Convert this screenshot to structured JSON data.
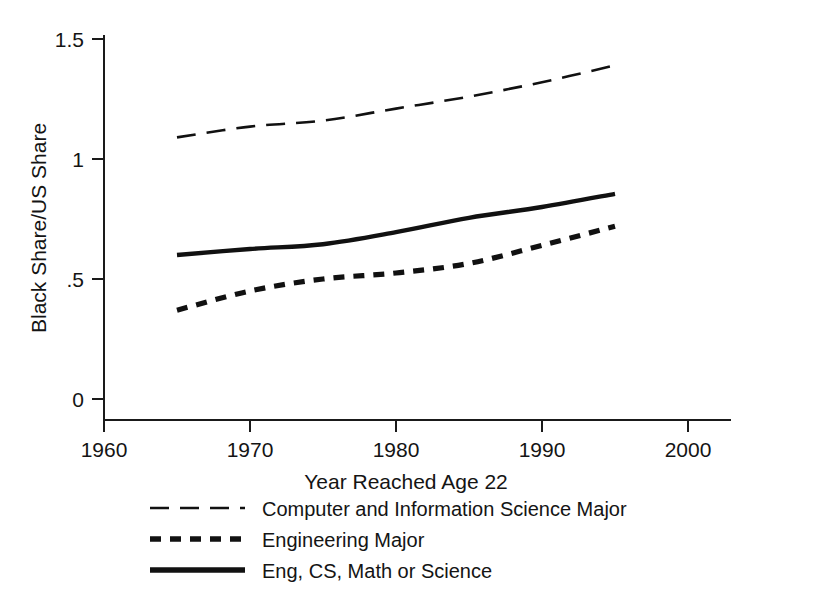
{
  "chart_data": {
    "type": "line",
    "title": "",
    "xlabel": "Year Reached Age 22",
    "ylabel": "Black Share/US Share",
    "xlim": [
      1960,
      2000
    ],
    "ylim": [
      0,
      1.5
    ],
    "grid": false,
    "legend_position": "below-plot",
    "x_ticks": [
      "1960",
      "1970",
      "1980",
      "1990",
      "2000"
    ],
    "x_tick_values": [
      1960,
      1970,
      1980,
      1990,
      2000
    ],
    "y_ticks": [
      "0",
      ".5",
      "1",
      "1.5"
    ],
    "y_tick_values": [
      0,
      0.5,
      1,
      1.5
    ],
    "x": [
      1965,
      1970,
      1975,
      1980,
      1985,
      1990,
      1995
    ],
    "series": [
      {
        "name": "Computer and Information Science Major",
        "style": "long-dash",
        "values": [
          1.09,
          1.135,
          1.16,
          1.21,
          1.26,
          1.32,
          1.39
        ]
      },
      {
        "name": "Engineering Major",
        "style": "short-dash-thick",
        "values": [
          0.37,
          0.45,
          0.5,
          0.525,
          0.565,
          0.64,
          0.72
        ]
      },
      {
        "name": "Eng, CS, Math or Science",
        "style": "solid-thick",
        "values": [
          0.6,
          0.625,
          0.645,
          0.695,
          0.755,
          0.8,
          0.855
        ]
      }
    ]
  },
  "axes": {
    "y_label": "Black Share/US Share",
    "x_label": "Year Reached Age 22",
    "y_tick_labels": [
      "1.5",
      "1",
      ".5",
      "0"
    ],
    "x_tick_labels": [
      "1960",
      "1970",
      "1980",
      "1990",
      "2000"
    ]
  },
  "legend": {
    "items": [
      {
        "label": "Computer and Information Science Major"
      },
      {
        "label": "Engineering Major"
      },
      {
        "label": "Eng, CS, Math or Science"
      }
    ]
  },
  "colors": {
    "line": "#111111",
    "axis": "#1a1a1a",
    "background": "#ffffff",
    "text": "#141414"
  }
}
